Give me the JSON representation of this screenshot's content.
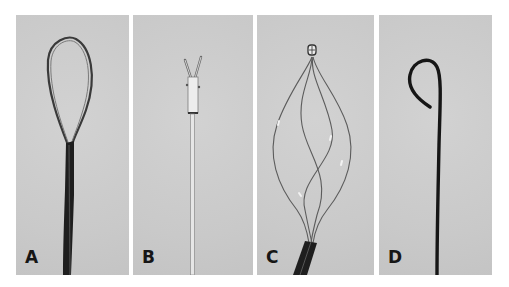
{
  "figure": {
    "panels": [
      {
        "label": "A",
        "subject": "wire loop snare with dark catheter sheath"
      },
      {
        "label": "B",
        "subject": "grasping forceps with thin shaft"
      },
      {
        "label": "C",
        "subject": "helical wire basket with tip cap and dark sheath"
      },
      {
        "label": "D",
        "subject": "J-tip guidewire"
      }
    ],
    "colors": {
      "background": "#ffffff",
      "panel": "#cdcdcd",
      "dark_instrument": "#1c1c1c",
      "wire": "#555555",
      "label": "#161616"
    }
  }
}
